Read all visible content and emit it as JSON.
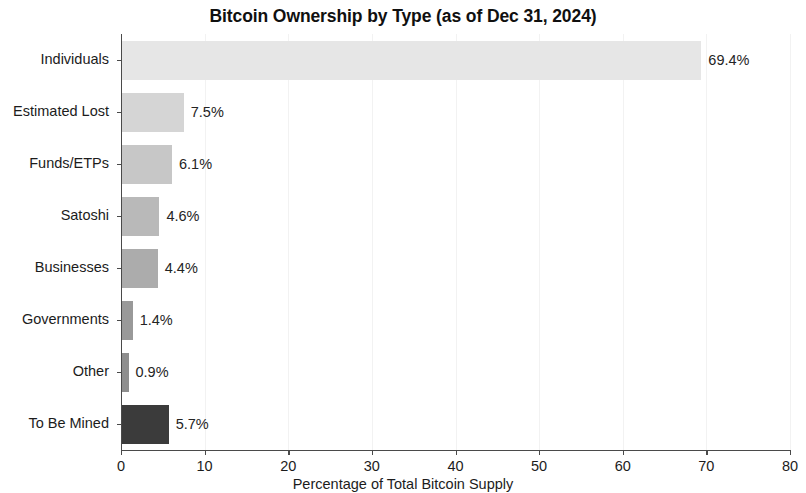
{
  "chart_data": {
    "type": "bar",
    "orientation": "horizontal",
    "title": "Bitcoin Ownership by Type (as of Dec 31, 2024)",
    "xlabel": "Percentage of Total Bitcoin Supply",
    "ylabel": "",
    "xlim": [
      0,
      80
    ],
    "xticks": [
      0,
      10,
      20,
      30,
      40,
      50,
      60,
      70,
      80
    ],
    "xtick_labels": [
      "0",
      "10",
      "20",
      "30",
      "40",
      "50",
      "60",
      "70",
      "80"
    ],
    "grid": true,
    "grid_axis": "x",
    "legend": false,
    "categories": [
      "Individuals",
      "Estimated Lost",
      "Funds/ETPs",
      "Satoshi",
      "Businesses",
      "Governments",
      "Other",
      "To Be Mined"
    ],
    "values": [
      69.4,
      7.5,
      6.1,
      4.6,
      4.4,
      1.4,
      0.9,
      5.7
    ],
    "value_labels": [
      "69.4%",
      "7.5%",
      "6.1%",
      "4.6%",
      "4.4%",
      "1.4%",
      "0.9%",
      "5.7%"
    ],
    "bar_colors": [
      "#e6e6e6",
      "#d5d5d5",
      "#c7c7c7",
      "#b9b9b9",
      "#acacac",
      "#999999",
      "#8e8e8e",
      "#3b3b3b"
    ]
  }
}
